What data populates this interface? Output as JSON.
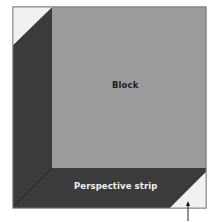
{
  "diagram": {
    "type": "quilt block perspective illustration",
    "labels": {
      "block": "Block",
      "strip": "Perspective strip"
    },
    "arrow": {
      "direction": "up",
      "points_to": "bottom-right light triangle",
      "caption": ""
    },
    "colors": {
      "block": "#9b9b9b",
      "strip": "#3b3b3b",
      "corner_triangle": "#f1f1f1",
      "seam": "#1c1c1c",
      "frame": "#7a7a7a",
      "label_dark": "#1e1e1e",
      "label_light": "#f2f2f2"
    }
  }
}
